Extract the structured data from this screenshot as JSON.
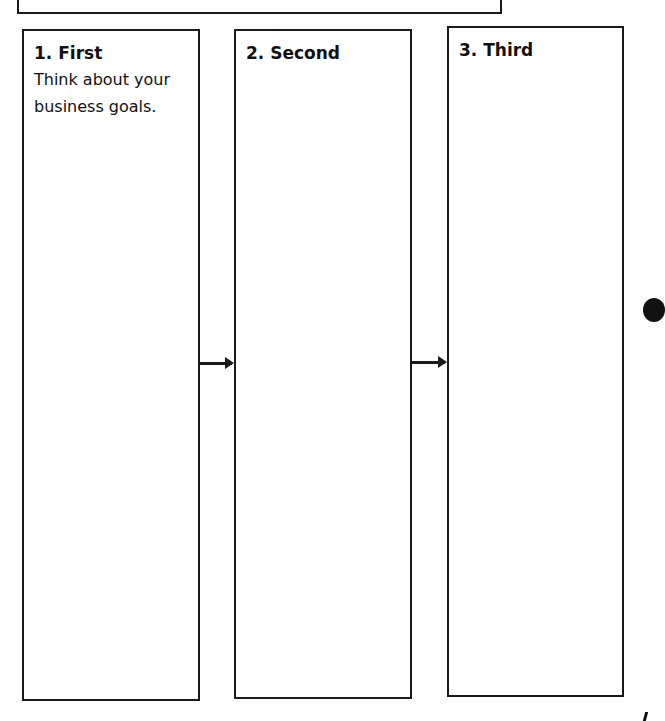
{
  "diagram": {
    "type": "flow-steps",
    "top_box": {
      "text": ""
    },
    "steps": [
      {
        "label": "1. First",
        "text": "Think about your business goals."
      },
      {
        "label": "2. Second",
        "text": ""
      },
      {
        "label": "3. Third",
        "text": ""
      }
    ],
    "connectors": [
      {
        "from": "1. First",
        "to": "2. Second",
        "style": "arrow"
      },
      {
        "from": "2. Second",
        "to": "3. Third",
        "style": "arrow"
      }
    ],
    "colors": {
      "stroke": "#1a1a1a",
      "background": "#ffffff",
      "text": "#111111"
    }
  }
}
